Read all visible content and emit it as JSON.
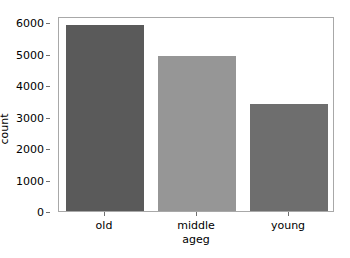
{
  "chart_data": {
    "type": "bar",
    "title": "",
    "xlabel": "ageg",
    "ylabel": "count",
    "categories": [
      "old",
      "middle",
      "young"
    ],
    "values": [
      5900,
      4940,
      3400
    ],
    "ylim": [
      0,
      6200
    ],
    "yticks": [
      0,
      1000,
      2000,
      3000,
      4000,
      5000,
      6000
    ],
    "ytick_labels": [
      "0",
      "1000",
      "2000",
      "3000",
      "4000",
      "5000",
      "6000"
    ],
    "grid": false,
    "legend": "none",
    "bar_colors": [
      "#5a5a5a",
      "#969696",
      "#6e6e6e"
    ],
    "background_color": "#ffffff",
    "axis_color": "#a8a8a8",
    "series": [
      {
        "name": "count",
        "points": [
          {
            "category": "old",
            "value": 5900,
            "color": "#5a5a5a"
          },
          {
            "category": "middle",
            "value": 4940,
            "color": "#969696"
          },
          {
            "category": "young",
            "value": 3400,
            "color": "#6e6e6e"
          }
        ]
      }
    ]
  }
}
